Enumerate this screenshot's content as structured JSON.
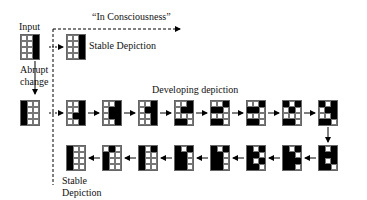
{
  "labels": {
    "input": "Input",
    "in_consciousness": "“In Consciousness”",
    "stable_depiction_top": "Stable Depiction",
    "abrupt_change_1": "Abrupt",
    "abrupt_change_2": "change",
    "developing_depiction": "Developing depiction",
    "stable_depiction_bottom_1": "Stable",
    "stable_depiction_bottom_2": "Depiction"
  },
  "grid_spec": {
    "cols": 3,
    "rows": 4
  },
  "grids": {
    "input": {
      "x": 20,
      "y": 34,
      "cells": "001001001001"
    },
    "stable_top": {
      "x": 66,
      "y": 34,
      "cells": "001001001001"
    },
    "changed": {
      "x": 20,
      "y": 100,
      "cells": "100100100100"
    },
    "dev_1": {
      "x": 66,
      "y": 100,
      "cells": "001001011001"
    },
    "dev_2": {
      "x": 102,
      "y": 100,
      "cells": "001011011001"
    },
    "dev_3": {
      "x": 138,
      "y": 100,
      "cells": "001011001001"
    },
    "dev_4": {
      "x": 174,
      "y": 100,
      "cells": "001011000110"
    },
    "dev_5": {
      "x": 210,
      "y": 100,
      "cells": "001110000110"
    },
    "dev_6": {
      "x": 246,
      "y": 100,
      "cells": "001110000110"
    },
    "dev_7": {
      "x": 282,
      "y": 100,
      "cells": "101010000110"
    },
    "dev_8": {
      "x": 318,
      "y": 100,
      "cells": "101011001110"
    },
    "dev_9": {
      "x": 318,
      "y": 145,
      "cells": "101111101110"
    },
    "dev_10": {
      "x": 282,
      "y": 145,
      "cells": "101110111110"
    },
    "dev_11": {
      "x": 246,
      "y": 145,
      "cells": "101110101110"
    },
    "dev_12": {
      "x": 210,
      "y": 145,
      "cells": "101110110110"
    },
    "dev_13": {
      "x": 174,
      "y": 145,
      "cells": "101110110110"
    },
    "dev_14": {
      "x": 138,
      "y": 145,
      "cells": "101100100100"
    },
    "dev_15": {
      "x": 102,
      "y": 145,
      "cells": "010100100100"
    },
    "stable_bottom": {
      "x": 66,
      "y": 145,
      "cells": "100100100100"
    }
  },
  "colors": {
    "ink": "#000000",
    "grid_line": "#777777",
    "background": "#ffffff"
  }
}
